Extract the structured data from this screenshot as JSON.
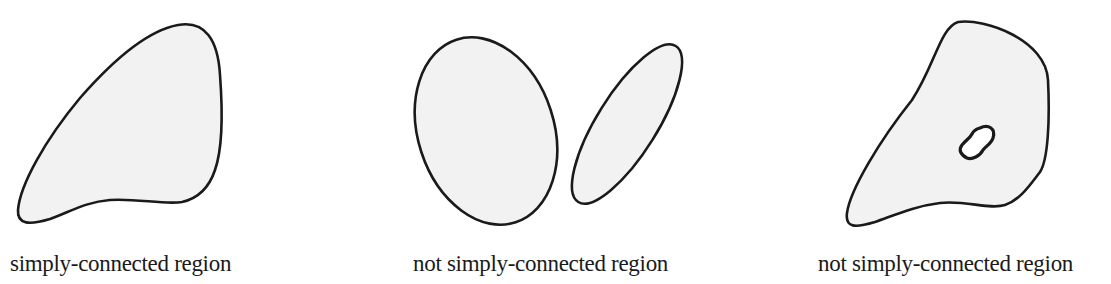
{
  "figure": {
    "panels": [
      {
        "id": "panel-1",
        "caption": "simply-connected region",
        "shape": "single-blob",
        "holes": 0,
        "components": 1
      },
      {
        "id": "panel-2",
        "caption": "not simply-connected region",
        "shape": "two-disjoint-ellipses",
        "holes": 0,
        "components": 2
      },
      {
        "id": "panel-3",
        "caption": "not simply-connected region",
        "shape": "blob-with-hole",
        "holes": 1,
        "components": 1
      }
    ],
    "colors": {
      "fill": "#f2f2f2",
      "stroke": "#1a1a1a",
      "background": "#ffffff"
    }
  }
}
